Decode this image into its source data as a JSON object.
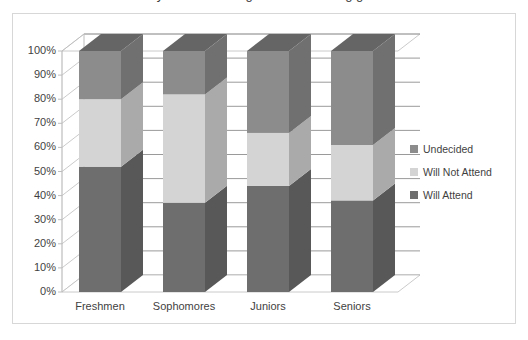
{
  "chart_data": {
    "type": "bar",
    "subtype": "stacked-100-percent-3d",
    "title": "Will you be attending the homecoming game?",
    "xlabel": "",
    "ylabel": "",
    "categories": [
      "Freshmen",
      "Sophomores",
      "Juniors",
      "Seniors"
    ],
    "series": [
      {
        "name": "Will Attend",
        "color": "#6e6e6e",
        "values": [
          52,
          37,
          44,
          38
        ]
      },
      {
        "name": "Will Not Attend",
        "color": "#d4d4d4",
        "values": [
          28,
          45,
          22,
          23
        ]
      },
      {
        "name": "Undecided",
        "color": "#8c8c8c",
        "values": [
          20,
          18,
          34,
          39
        ]
      }
    ],
    "stack_order_bottom_to_top": [
      "Will Attend",
      "Will Not Attend",
      "Undecided"
    ],
    "ylim": [
      0,
      100
    ],
    "yticks": [
      "0%",
      "10%",
      "20%",
      "30%",
      "40%",
      "50%",
      "60%",
      "70%",
      "80%",
      "90%",
      "100%"
    ],
    "ytick_values": [
      0,
      10,
      20,
      30,
      40,
      50,
      60,
      70,
      80,
      90,
      100
    ],
    "grid": true,
    "grid_axis": "y",
    "legend_position": "right",
    "legend_entries": [
      {
        "label": "Undecided",
        "color": "#8c8c8c"
      },
      {
        "label": "Will Not Attend",
        "color": "#d4d4d4"
      },
      {
        "label": "Will Attend",
        "color": "#6e6e6e"
      }
    ],
    "colors": {
      "plot_background": "#ffffff",
      "frame_border": "#d7d7d7",
      "gridline": "#9a9a9a",
      "axis_line": "#bdbdbd",
      "tick_text": "#3f3f3f",
      "floor": "#ffffff"
    }
  }
}
